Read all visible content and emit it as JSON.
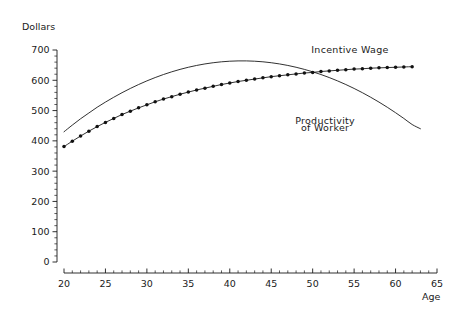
{
  "chart_data": {
    "type": "line",
    "title": "",
    "xlabel": "Age",
    "ylabel": "Dollars",
    "xlim": [
      20,
      65
    ],
    "ylim": [
      0,
      700
    ],
    "xticks": [
      20,
      25,
      30,
      35,
      40,
      45,
      50,
      55,
      60,
      65
    ],
    "xtick_labels": [
      "20",
      "25",
      "30",
      "35",
      "40",
      "45",
      "50",
      "55",
      "60",
      "65"
    ],
    "yticks": [
      0,
      100,
      200,
      300,
      400,
      500,
      600,
      700
    ],
    "ytick_labels": [
      "0",
      "100",
      "200",
      "300",
      "400",
      "500",
      "600",
      "700"
    ],
    "x_minor_step": 1,
    "y_minor_step": 20,
    "grid": false,
    "legend_position": "inline-annotations",
    "annotations": [
      {
        "text": "Incentive Wage",
        "x": 54.5,
        "y": 690
      },
      {
        "text": "Productivity",
        "x": 51.5,
        "y": 455
      },
      {
        "text": "of Worker",
        "x": 51.5,
        "y": 432
      }
    ],
    "series": [
      {
        "name": "Productivity of Worker",
        "style": "smooth-line",
        "markers": false,
        "x": [
          20,
          21,
          22,
          23,
          24,
          25,
          26,
          27,
          28,
          29,
          30,
          31,
          32,
          33,
          34,
          35,
          36,
          37,
          38,
          39,
          40,
          41,
          42,
          43,
          44,
          45,
          46,
          47,
          48,
          49,
          50,
          51,
          52,
          53,
          54,
          55,
          56,
          57,
          58,
          59,
          60,
          61,
          62,
          63
        ],
        "values": [
          430,
          452,
          473,
          492,
          511,
          528,
          544,
          559,
          573,
          586,
          598,
          609,
          619,
          628,
          636,
          643,
          649,
          654,
          658,
          661,
          663,
          664,
          664,
          663,
          661,
          658,
          654,
          649,
          643,
          636,
          628,
          619,
          609,
          598,
          586,
          573,
          559,
          544,
          528,
          511,
          493,
          474,
          454,
          440
        ]
      },
      {
        "name": "Incentive Wage",
        "style": "marked-line",
        "markers": true,
        "x": [
          20,
          21,
          22,
          23,
          24,
          25,
          26,
          27,
          28,
          29,
          30,
          31,
          32,
          33,
          34,
          35,
          36,
          37,
          38,
          39,
          40,
          41,
          42,
          43,
          44,
          45,
          46,
          47,
          48,
          49,
          50,
          51,
          52,
          53,
          54,
          55,
          56,
          57,
          58,
          59,
          60,
          61,
          62
        ],
        "values": [
          381,
          399,
          416,
          432,
          447,
          461,
          474,
          487,
          498,
          509,
          519,
          529,
          538,
          546,
          554,
          561,
          568,
          574,
          580,
          586,
          591,
          596,
          600,
          604,
          608,
          612,
          615,
          618,
          621,
          624,
          626,
          629,
          631,
          633,
          635,
          637,
          638,
          640,
          641,
          642,
          643,
          644,
          645
        ]
      }
    ]
  }
}
